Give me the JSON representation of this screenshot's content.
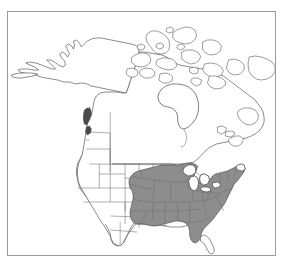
{
  "figure": {
    "frame": {
      "border_color": "#9a9a9a",
      "background_color": "#ffffff"
    }
  },
  "map": {
    "region_name": "North America",
    "projection_hint": "conic",
    "outline_color": "#5a5a5a",
    "subdivision_color": "#6e6e6e",
    "unshaded_fill": "#ffffff",
    "shaded_fill": "#8d8d8d",
    "shaded_accent_fill": "#4a4a4a",
    "landmasses": [
      {
        "name": "alaska",
        "shaded": false
      },
      {
        "name": "canada-mainland",
        "shaded": false
      },
      {
        "name": "canadian-arctic-archipelago",
        "shaded": false
      },
      {
        "name": "greenland-edge",
        "shaded": false
      },
      {
        "name": "united-states-contiguous",
        "shaded": "partial"
      },
      {
        "name": "mexico-northern",
        "shaded": false
      }
    ],
    "water_bodies": [
      {
        "name": "hudson-bay"
      },
      {
        "name": "great-lakes"
      }
    ],
    "shaded_range": {
      "label": "shaded distribution range",
      "description": "Eastern United States",
      "fill": "#8d8d8d",
      "areas": [
        "eastern-united-states",
        "great-lakes-states",
        "mid-atlantic",
        "new-england",
        "southeast",
        "gulf-coast-states",
        "eastern-texas"
      ],
      "excluded_areas": [
        "florida-peninsula",
        "northern-maine"
      ],
      "disjunct_patches": [
        {
          "name": "pacific-northwest-patch",
          "fill": "#4a4a4a"
        }
      ]
    }
  }
}
